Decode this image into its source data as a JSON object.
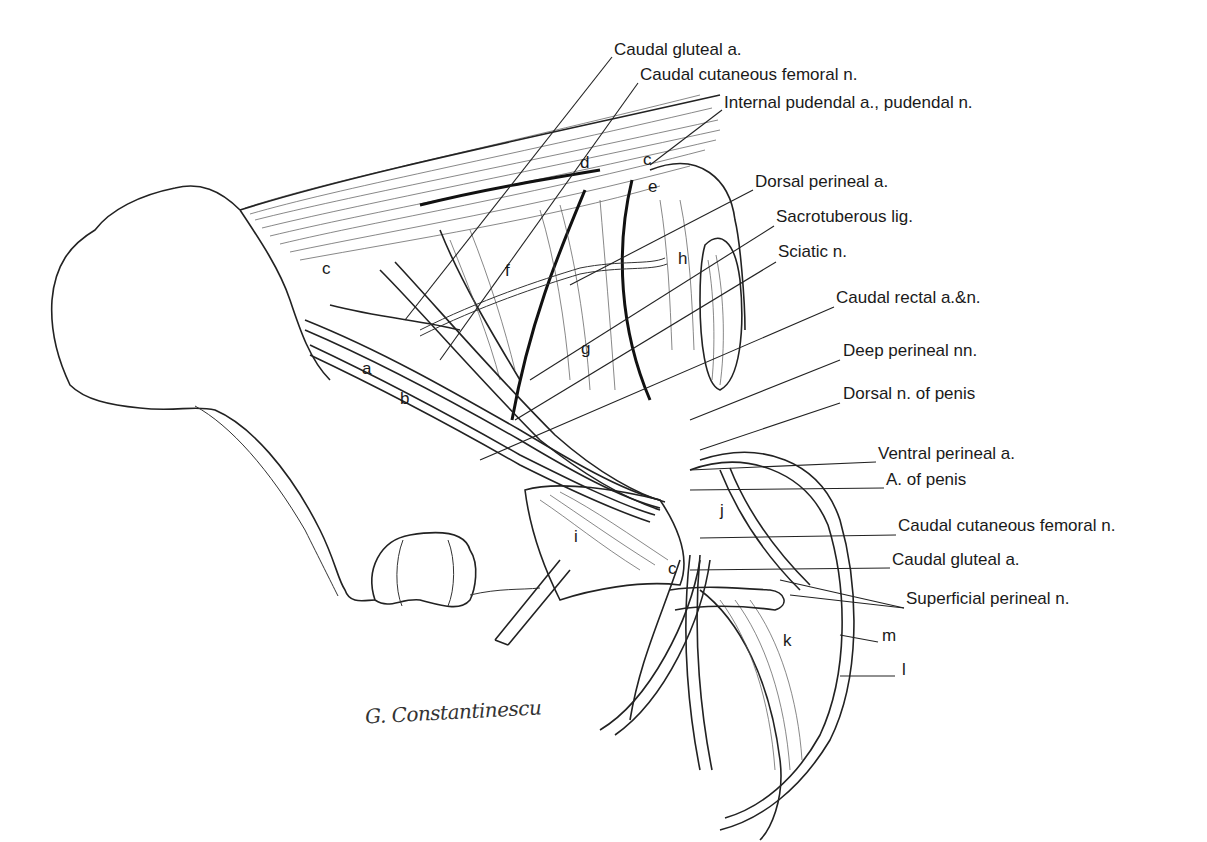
{
  "figure": {
    "type": "anatomical line drawing",
    "signature": "G. Constantinescu"
  },
  "labels": [
    {
      "id": "caudal-gluteal-a-top",
      "text": "Caudal gluteal a.",
      "x": 614,
      "y": 48
    },
    {
      "id": "caudal-cutaneous-femoral-n-top",
      "text": "Caudal cutaneous femoral n.",
      "x": 640,
      "y": 73
    },
    {
      "id": "internal-pudendal",
      "text": "Internal pudendal a., pudendal n.",
      "x": 724,
      "y": 101
    },
    {
      "id": "dorsal-perineal-a",
      "text": "Dorsal perineal a.",
      "x": 755,
      "y": 178
    },
    {
      "id": "sacrotuberous-lig",
      "text": "Sacrotuberous lig.",
      "x": 776,
      "y": 215
    },
    {
      "id": "sciatic-n",
      "text": "Sciatic n.",
      "x": 778,
      "y": 250
    },
    {
      "id": "caudal-rectal",
      "text": "Caudal rectal a.&n.",
      "x": 836,
      "y": 295
    },
    {
      "id": "deep-perineal-nn",
      "text": "Deep perineal nn.",
      "x": 843,
      "y": 348
    },
    {
      "id": "dorsal-n-penis",
      "text": "Dorsal n. of penis",
      "x": 843,
      "y": 391
    },
    {
      "id": "ventral-perineal-a",
      "text": "Ventral perineal a.",
      "x": 878,
      "y": 451
    },
    {
      "id": "a-of-penis",
      "text": "A. of penis",
      "x": 886,
      "y": 477
    },
    {
      "id": "caudal-cutaneous-femoral-n-bottom",
      "text": "Caudal cutaneous femoral n.",
      "x": 898,
      "y": 523
    },
    {
      "id": "caudal-gluteal-a-bottom",
      "text": "Caudal gluteal a.",
      "x": 892,
      "y": 557
    },
    {
      "id": "superficial-perineal-n",
      "text": "Superficial perineal n.",
      "x": 906,
      "y": 596
    }
  ],
  "letters": [
    {
      "text": "c",
      "x": 325,
      "y": 262
    },
    {
      "text": "a",
      "x": 364,
      "y": 362
    },
    {
      "text": "b",
      "x": 402,
      "y": 392
    },
    {
      "text": "d",
      "x": 582,
      "y": 157
    },
    {
      "text": "c",
      "x": 645,
      "y": 153
    },
    {
      "text": "e",
      "x": 650,
      "y": 180
    },
    {
      "text": "f",
      "x": 506,
      "y": 264
    },
    {
      "text": "g",
      "x": 583,
      "y": 343
    },
    {
      "text": "h",
      "x": 680,
      "y": 253
    },
    {
      "text": "i",
      "x": 575,
      "y": 530
    },
    {
      "text": "j",
      "x": 720,
      "y": 505
    },
    {
      "text": "c",
      "x": 670,
      "y": 562
    },
    {
      "text": "k",
      "x": 785,
      "y": 635
    },
    {
      "text": "m",
      "x": 884,
      "y": 630
    },
    {
      "text": "l",
      "x": 903,
      "y": 664
    }
  ]
}
